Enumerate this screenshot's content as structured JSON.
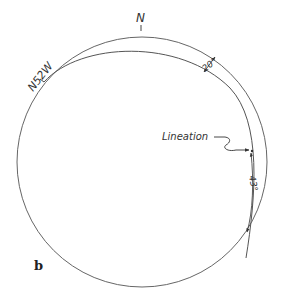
{
  "figure": {
    "panel_label": "b",
    "labels": {
      "north": "N",
      "strike": "N52W",
      "dip": "20°",
      "lineation": "Lineation",
      "rake": "43°"
    }
  },
  "colors": {
    "line": "#555555",
    "text": "#333333",
    "background": "#ffffff"
  }
}
